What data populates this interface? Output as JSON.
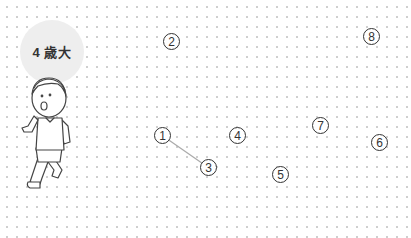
{
  "game": {
    "age_label": "4 歳大",
    "badge_color": "#eeeeee",
    "line_color": "#aaaaaa",
    "points": [
      {
        "label": "1",
        "x": 163,
        "y": 136
      },
      {
        "label": "2",
        "x": 172,
        "y": 42
      },
      {
        "label": "3",
        "x": 209,
        "y": 168
      },
      {
        "label": "4",
        "x": 238,
        "y": 136
      },
      {
        "label": "5",
        "x": 281,
        "y": 175
      },
      {
        "label": "6",
        "x": 380,
        "y": 143
      },
      {
        "label": "7",
        "x": 321,
        "y": 126
      },
      {
        "label": "8",
        "x": 372,
        "y": 37
      }
    ],
    "connected": [
      [
        1,
        3
      ]
    ]
  }
}
